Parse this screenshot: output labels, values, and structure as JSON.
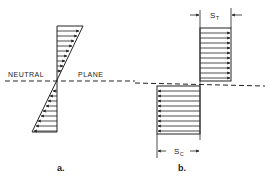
{
  "figure": {
    "labels": {
      "neutral": "NEUTRAL",
      "plane": "PLANE",
      "part_a": "a.",
      "part_b": "b.",
      "tension_symbol": "S",
      "tension_sub": "T",
      "compression_symbol": "S",
      "compression_sub": "C"
    },
    "colors": {
      "line": "#222222",
      "background": "#ffffff"
    },
    "part_a": {
      "description": "Linear (triangular) stress distribution about neutral plane",
      "axis_x": 57,
      "top_y": 26,
      "bottom_y": 132,
      "neutral_y": 81,
      "top_right_x": 83,
      "bottom_left_x": 32,
      "arrows_above": 10,
      "arrows_below": 10
    },
    "part_b": {
      "description": "Uniform (rectangular) stress distribution: tension above, compression below",
      "axis_x": 200,
      "tension_rect": {
        "x_right": 231,
        "top_y": 28,
        "bottom_y": 81
      },
      "compression_rect": {
        "x_left": 157,
        "top_y": 86,
        "bottom_y": 134
      },
      "arrows_tension": 11,
      "arrows_compression": 10
    }
  }
}
